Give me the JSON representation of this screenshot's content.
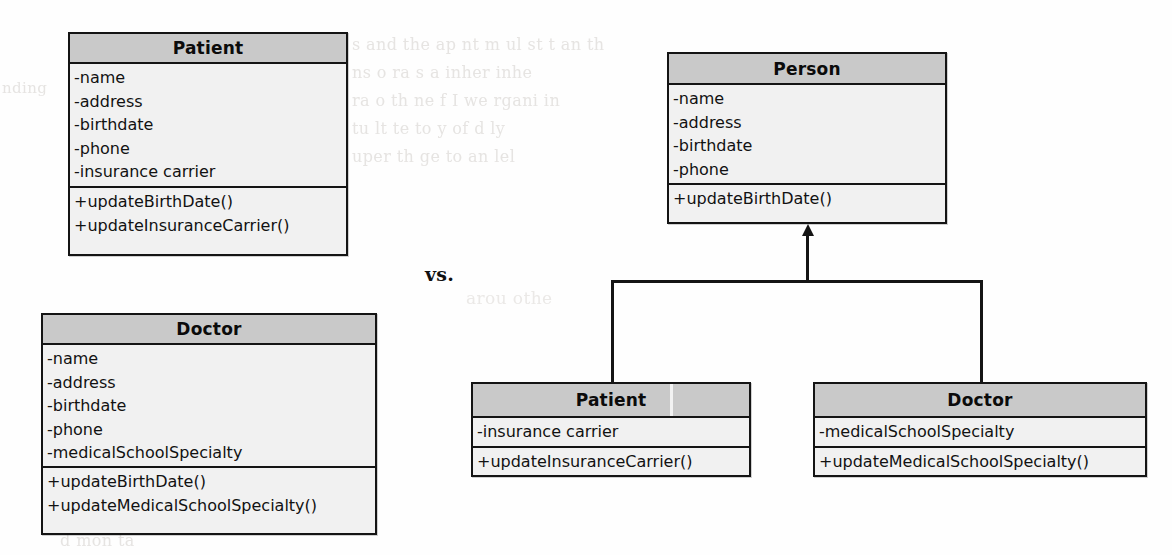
{
  "diagram": {
    "comparison_label": "vs.",
    "colors": {
      "header_fill": "#c9c9c9",
      "body_fill": "#f1f1f1",
      "stroke": "#141414",
      "background": "#fefefe",
      "ghost_text": "#e6e4e2"
    },
    "left_side": {
      "classes": [
        {
          "name": "Patient",
          "attributes": [
            "-name",
            "-address",
            "-birthdate",
            "-phone",
            "-insurance carrier"
          ],
          "operations": [
            "+updateBirthDate()",
            "+updateInsuranceCarrier()"
          ]
        },
        {
          "name": "Doctor",
          "attributes": [
            "-name",
            "-address",
            "-birthdate",
            "-phone",
            "-medicalSchoolSpecialty"
          ],
          "operations": [
            "+updateBirthDate()",
            "+updateMedicalSchoolSpecialty()"
          ]
        }
      ]
    },
    "right_side": {
      "superclass": {
        "name": "Person",
        "attributes": [
          "-name",
          "-address",
          "-birthdate",
          "-phone"
        ],
        "operations": [
          "+updateBirthDate()"
        ]
      },
      "subclasses": [
        {
          "name": "Patient",
          "attributes": [
            "-insurance carrier"
          ],
          "operations": [
            "+updateInsuranceCarrier()"
          ]
        },
        {
          "name": "Doctor",
          "attributes": [
            "-medicalSchoolSpecialty"
          ],
          "operations": [
            "+updateMedicalSchoolSpecialty()"
          ]
        }
      ],
      "relationship": {
        "type": "generalization",
        "arrow": "solid-triangle-up",
        "from": [
          "Patient",
          "Doctor"
        ],
        "to": "Person"
      }
    },
    "ghost_text_lines": [
      "nding",
      "s and the ap    nt  m  ul    st t  an    th",
      "ns    o     ra   s   a     inher   inhe",
      "ra  o  th       ne   f I   we     rgani  in",
      "tu  lt       te      to      y of  d    ly",
      "uper     th         ge   to    an  lel",
      "arou   othe",
      "d  mon    ta"
    ]
  }
}
